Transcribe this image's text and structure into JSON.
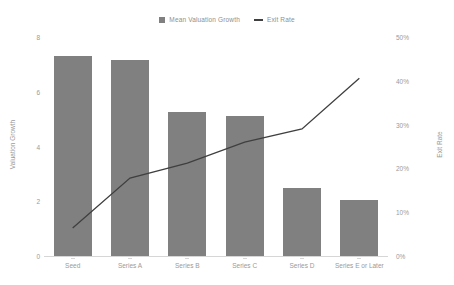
{
  "chart_data": {
    "type": "bar",
    "title": "",
    "subtitle": "",
    "xlabel": "",
    "ylabel": "Valuation Growth",
    "y2label": "Exit Rate",
    "grid": false,
    "legend_position": "top-center",
    "categories": [
      "Seed",
      "Series A",
      "Series B",
      "Series C",
      "Series D",
      "Series E or Later"
    ],
    "ylim": [
      0,
      8
    ],
    "yticks": [
      0,
      2,
      4,
      6,
      8
    ],
    "ytick_labels": [
      "0",
      "2",
      "4",
      "6",
      "8"
    ],
    "y2lim": [
      0,
      50
    ],
    "y2ticks": [
      0,
      10,
      20,
      30,
      40,
      50
    ],
    "y2tick_labels": [
      "0%",
      "10%",
      "20%",
      "30%",
      "40%",
      "50%"
    ],
    "series": [
      {
        "name": "Mean Valuation Growth",
        "type": "bar",
        "axis": "left",
        "color": "#808080",
        "values": [
          7.3,
          7.15,
          5.25,
          5.1,
          2.5,
          2.05
        ]
      },
      {
        "name": "Exit Rate",
        "type": "line",
        "axis": "right",
        "color": "#3f3f3f",
        "values": [
          6.4,
          17.8,
          21.2,
          26.0,
          29.0,
          40.6
        ]
      }
    ]
  },
  "legend": {
    "entries": [
      {
        "label": "Mean Valuation Growth",
        "marker": "square-swatch-icon"
      },
      {
        "label": "Exit Rate",
        "marker": "line-swatch-icon"
      }
    ]
  }
}
